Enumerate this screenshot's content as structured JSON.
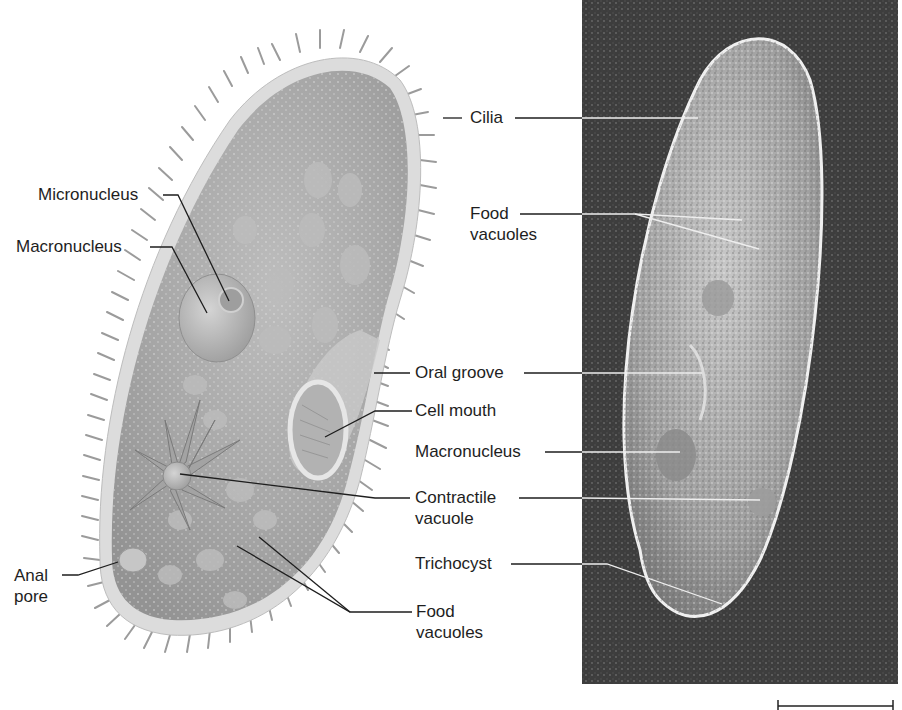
{
  "figure": {
    "panels": [
      {
        "id": "illustration",
        "description": "Labeled drawing of a paramecium"
      },
      {
        "id": "micrograph",
        "description": "Light micrograph of a paramecium"
      }
    ]
  },
  "labels": {
    "illustration_left": [
      {
        "id": "micronucleus",
        "text": "Micronucleus"
      },
      {
        "id": "macronucleus",
        "text": "Macronucleus"
      },
      {
        "id": "anal_pore",
        "lines": [
          "Anal",
          "pore"
        ]
      }
    ],
    "center": [
      {
        "id": "cilia",
        "text": "Cilia"
      },
      {
        "id": "food_vacuoles_top",
        "lines": [
          "Food",
          "vacuoles"
        ]
      },
      {
        "id": "oral_groove",
        "text": "Oral groove"
      },
      {
        "id": "cell_mouth",
        "text": "Cell mouth"
      },
      {
        "id": "macronucleus_photo",
        "text": "Macronucleus"
      },
      {
        "id": "contractile_vacuole",
        "lines": [
          "Contractile",
          "vacuole"
        ]
      },
      {
        "id": "trichocyst",
        "text": "Trichocyst"
      },
      {
        "id": "food_vacuoles_bottom",
        "lines": [
          "Food",
          "vacuoles"
        ]
      }
    ]
  },
  "scale_bar": {
    "visible": true,
    "label": ""
  },
  "colors": {
    "background": "#ffffff",
    "cell_fill": "#a8a8a8",
    "pellicle": "#dcdcdc",
    "cilia": "#8a8a8a",
    "photo_bg": "#3a3a3a",
    "leader_line": "#1e1e1e",
    "leader_line_photo": "#e8e8e8"
  }
}
